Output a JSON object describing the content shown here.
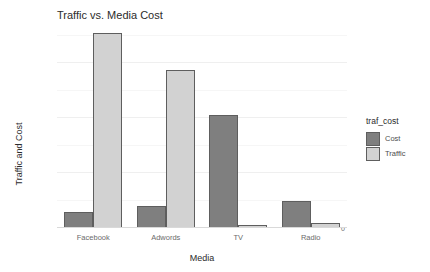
{
  "chart_data": {
    "type": "bar",
    "title": "Traffic vs. Media Cost",
    "xlabel": "Media",
    "ylabel": "Traffic and Cost",
    "categories": [
      "Facebook",
      "Adwords",
      "TV",
      "Radio"
    ],
    "series": [
      {
        "name": "Cost",
        "color": "#7f7f7f",
        "values": [
          6000000,
          8000000,
          41000000,
          10000000
        ]
      },
      {
        "name": "Traffic",
        "color": "#d2d2d2",
        "values": [
          71000000,
          57500000,
          1000000,
          2000000
        ]
      }
    ],
    "legend": {
      "title": "traf_cost",
      "position": "right",
      "entries": [
        "Cost",
        "Traffic"
      ]
    },
    "ylim": [
      0,
      75000000
    ],
    "yticks": [
      0,
      20000000,
      40000000,
      60000000
    ],
    "ytick_labels": [
      "0",
      "20000000",
      "40000000",
      "60000000"
    ],
    "grid": true,
    "background": "#ffffff"
  }
}
